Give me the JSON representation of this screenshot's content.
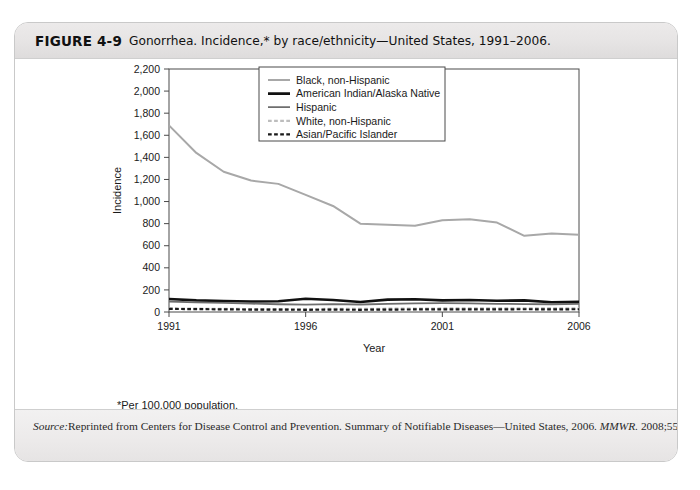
{
  "figure": {
    "number": "FIGURE 4-9",
    "caption": "Gonorrhea. Incidence,* by race/ethnicity—United States, 1991–2006.",
    "footnote": "*Per 100,000 population.",
    "source_label": "Source:",
    "source_text": "Reprinted from Centers for Disease Control and Prevention. Summary of Notifiable Diseases—United States, 2006. ",
    "source_journal": "MMWR.",
    "source_citation": " 2008;55:52."
  },
  "chart_data": {
    "type": "line",
    "title": "",
    "xlabel": "Year",
    "ylabel": "Incidence",
    "xlim": [
      1991,
      2006
    ],
    "ylim": [
      0,
      2200
    ],
    "ytick_step": 200,
    "ytick_labels": [
      "0",
      "200",
      "400",
      "600",
      "800",
      "1,000",
      "1,200",
      "1,400",
      "1,600",
      "1,800",
      "2,000",
      "2,200"
    ],
    "ytick_values": [
      0,
      200,
      400,
      600,
      800,
      1000,
      1200,
      1400,
      1600,
      1800,
      2000,
      2200
    ],
    "xtick_labels": [
      "1991",
      "1996",
      "2001",
      "2006"
    ],
    "xtick_values": [
      1991,
      1996,
      2001,
      2006
    ],
    "grid": false,
    "legend_position": "top-right",
    "x": [
      1991,
      1992,
      1993,
      1994,
      1995,
      1996,
      1997,
      1998,
      1999,
      2000,
      2001,
      2002,
      2003,
      2004,
      2005,
      2006
    ],
    "series": [
      {
        "name": "Black, non-Hispanic",
        "color": "#a8a8a8",
        "width": 2.0,
        "dash": "none",
        "values": [
          1690,
          1440,
          1270,
          1190,
          1160,
          1060,
          960,
          800,
          790,
          780,
          830,
          840,
          810,
          690,
          710,
          700
        ]
      },
      {
        "name": "American Indian/Alaska Native",
        "color": "#111111",
        "width": 2.6,
        "dash": "none",
        "values": [
          118,
          105,
          100,
          95,
          98,
          120,
          108,
          90,
          112,
          115,
          105,
          108,
          102,
          105,
          88,
          92
        ]
      },
      {
        "name": "Hispanic",
        "color": "#6e6e6e",
        "width": 1.8,
        "dash": "none",
        "values": [
          95,
          88,
          82,
          76,
          70,
          66,
          72,
          68,
          74,
          78,
          80,
          78,
          74,
          72,
          70,
          74
        ]
      },
      {
        "name": "White, non-Hispanic",
        "color": "#bdbdbd",
        "width": 2.2,
        "dash": "dashed",
        "values": [
          32,
          30,
          28,
          27,
          26,
          26,
          28,
          28,
          30,
          31,
          32,
          33,
          34,
          34,
          33,
          34
        ]
      },
      {
        "name": "Asian/Pacific Islander",
        "color": "#1a1a1a",
        "width": 2.2,
        "dash": "dashed",
        "values": [
          28,
          26,
          24,
          22,
          21,
          20,
          21,
          20,
          22,
          23,
          24,
          24,
          24,
          25,
          24,
          25
        ]
      }
    ],
    "series_right_tail": {
      "Black, non-Hispanic": [
        830,
        840,
        810,
        690,
        710,
        700
      ]
    }
  }
}
